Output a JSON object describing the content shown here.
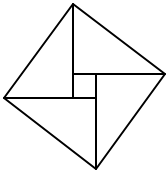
{
  "diagram": {
    "stroke_color": "#000000",
    "background": "#ffffff",
    "outer_square": [
      [
        73,
        4
      ],
      [
        165,
        74
      ],
      [
        96,
        169
      ],
      [
        4,
        98
      ]
    ],
    "inner_lines": [
      {
        "name": "top-to-inner",
        "x1": 73,
        "y1": 4,
        "x2": 73,
        "y2": 98
      },
      {
        "name": "right-to-inner",
        "x1": 165,
        "y1": 74,
        "x2": 73,
        "y2": 74
      },
      {
        "name": "bottom-to-inner",
        "x1": 96,
        "y1": 169,
        "x2": 96,
        "y2": 74
      },
      {
        "name": "left-to-inner",
        "x1": 4,
        "y1": 98,
        "x2": 96,
        "y2": 98
      }
    ]
  }
}
